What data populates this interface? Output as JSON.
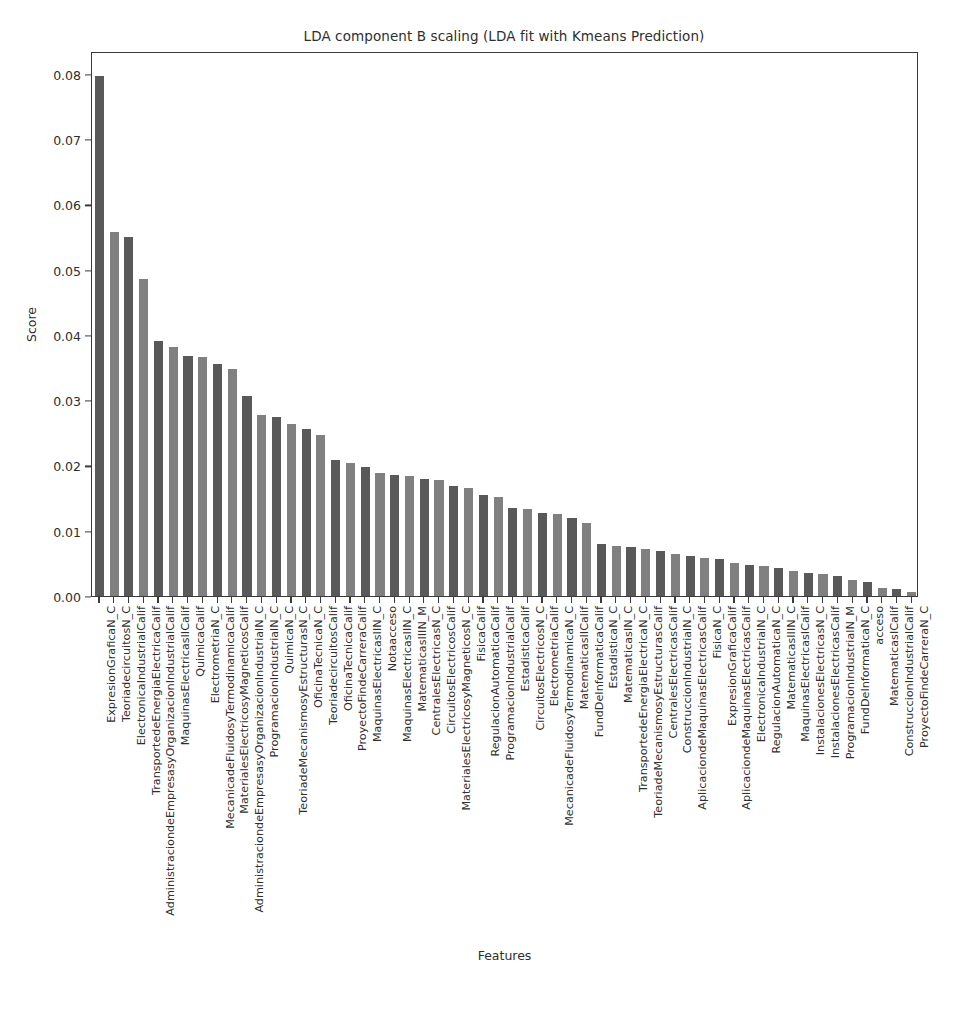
{
  "chart_data": {
    "type": "bar",
    "title": "LDA component B scaling (LDA fit with Kmeans Prediction)",
    "xlabel": "Features",
    "ylabel": "Score",
    "ylim": [
      0,
      0.0835
    ],
    "ytick_labels": [
      "0.00",
      "0.01",
      "0.02",
      "0.03",
      "0.04",
      "0.05",
      "0.06",
      "0.07",
      "0.08"
    ],
    "ytick_values": [
      0.0,
      0.01,
      0.02,
      0.03,
      0.04,
      0.05,
      0.06,
      0.07,
      0.08
    ],
    "grid": false,
    "legend": "none",
    "bar_colors": [
      "#595959",
      "#808080"
    ],
    "categories": [
      "ExpresionGraficaN_C",
      "TeoriadecircuitosN_C",
      "ElectronicaIndustrialCalif",
      "TransportedeEnergiaElectricaCalif",
      "AdministraciondeEmpresasyOrganizacionIndustrialCalif",
      "MaquinasElectricasIICalif",
      "QuimicaCalif",
      "ElectrometriaN_C",
      "MecanicadeFluidosyTermodinamicaCalif",
      "MaterialesElectricosyMagneticosCalif",
      "AdministraciondeEmpresasyOrganizacionIndustrialN_C",
      "ProgramacionIndustrialN_C",
      "QuimicaN_C",
      "TeoriadeMecanismosyEstructurasN_C",
      "OficinaTecnicaN_C",
      "TeoriadecircuitosCalif",
      "OficinaTecnicaCalif",
      "ProyectoFindeCarreraCalif",
      "MaquinasElectricasIIN_C",
      "Notaacceso",
      "MaquinasElectricasIIN_C",
      "MatematicasIIIN_M",
      "CentralesElectricasN_C",
      "CircuitosElectricosCalif",
      "MaterialesElectricosyMagneticosN_C",
      "FisicaCalif",
      "RegulacionAutomaticaCalif",
      "ProgramacionIndustrialCalif",
      "EstadisticaCalif",
      "CircuitosElectricosN_C",
      "ElectrometriaCalif",
      "MecanicadeFluidosyTermodinamicaN_C",
      "MatematicasIICalif",
      "FundDeInformaticaCalif",
      "EstadisticaN_C",
      "MatematicasIN_C",
      "TransportedeEnergiaElectricaN_C",
      "TeoriadeMecanismosyEstructurasCalif",
      "CentralesElectricasCalif",
      "ConstruccionIndustrialN_C",
      "AplicaciondeMaquinasElectricasCalif",
      "FisicaN_C",
      "ExpresionGraficaCalif",
      "AplicaciondeMaquinasElectricasCalif",
      "ElectronicaIndustrialN_C",
      "RegulacionAutomaticaN_C",
      "MatematicasIIIN_C",
      "MaquinasElectricasICalif",
      "InstalacionesElectricasN_C",
      "InstalacionesElectricasCalif",
      "ProgramacionIndustrialN_M",
      "FundDeInformaticaN_C",
      "acceso",
      "MatematicasICalif",
      "ConstruccionIndustrialCalif",
      "ProyectoFindeCarreraN_C"
    ],
    "values": [
      0.0797,
      0.0557,
      0.055,
      0.0485,
      0.039,
      0.0382,
      0.0368,
      0.0366,
      0.0355,
      0.0348,
      0.0307,
      0.0277,
      0.0275,
      0.0263,
      0.0256,
      0.0246,
      0.0209,
      0.0204,
      0.0198,
      0.0188,
      0.0186,
      0.0184,
      0.0179,
      0.0178,
      0.0169,
      0.0166,
      0.0155,
      0.0152,
      0.0135,
      0.0133,
      0.0127,
      0.0125,
      0.012,
      0.0112,
      0.0079,
      0.0077,
      0.0075,
      0.0072,
      0.0069,
      0.0064,
      0.0062,
      0.0059,
      0.0057,
      0.0051,
      0.0048,
      0.0046,
      0.0043,
      0.0039,
      0.0035,
      0.0033,
      0.0031,
      0.0025,
      0.0022,
      0.0013,
      0.001,
      0.0006
    ]
  }
}
